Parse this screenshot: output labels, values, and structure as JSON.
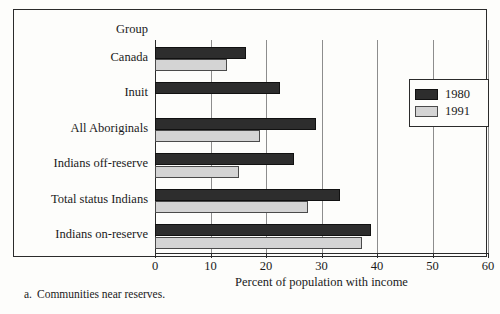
{
  "figure": {
    "group_header": "Group",
    "footnote_marker": "a.",
    "footnote_text": "Communities near reserves."
  },
  "legend": {
    "entries": [
      {
        "label": "1980",
        "color": "#2d2d2d"
      },
      {
        "label": "1991",
        "color": "#d4d4d4"
      }
    ]
  },
  "chart_data": {
    "type": "bar",
    "orientation": "horizontal",
    "title": "",
    "subtitle": "",
    "xlabel": "Percent of population with income",
    "ylabel": "Group",
    "categories": [
      "Canada",
      "Inuit",
      "All Aboriginals",
      "Indians off-reserve",
      "Total status Indians",
      "Indians on-reserve"
    ],
    "series": [
      {
        "name": "1980",
        "color": "#2d2d2d",
        "values": [
          16.4,
          22.6,
          29.0,
          25.1,
          33.3,
          38.9
        ]
      },
      {
        "name": "1991",
        "color": "#d4d4d4",
        "values": [
          13.0,
          null,
          19.0,
          15.2,
          27.6,
          37.3
        ]
      }
    ],
    "xlim": [
      0,
      60
    ],
    "xticks": [
      0,
      10,
      20,
      30,
      40,
      50,
      60
    ],
    "xtick_labels": [
      "0",
      "10",
      "20",
      "30",
      "40",
      "50",
      "60"
    ],
    "grid": true,
    "grid_axis": "x",
    "legend_position": "right"
  }
}
